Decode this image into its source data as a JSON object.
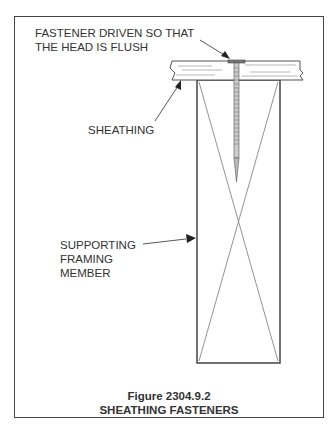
{
  "figure": {
    "number": "Figure 2304.9.2",
    "title": "SHEATHING FASTENERS"
  },
  "labels": {
    "fastener": [
      "FASTENER DRIVEN SO THAT",
      "THE HEAD IS FLUSH"
    ],
    "sheathing": "SHEATHING",
    "framing": [
      "SUPPORTING",
      "FRAMING",
      "MEMBER"
    ]
  },
  "colors": {
    "line": "#444444",
    "text": "#333333"
  }
}
